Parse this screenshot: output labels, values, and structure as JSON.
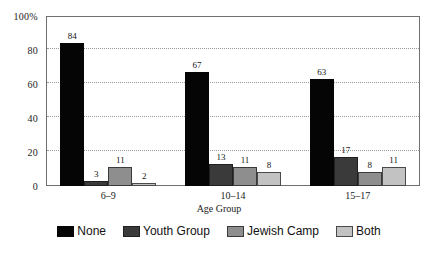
{
  "chart_data": {
    "type": "bar",
    "title": "",
    "xlabel": "Age Group",
    "ylabel": "",
    "ylim": [
      0,
      100
    ],
    "grid": true,
    "legend_position": "bottom",
    "categories": [
      "6–9",
      "10–14",
      "15–17"
    ],
    "yticks": [
      "0",
      "20",
      "40",
      "60",
      "80",
      "100%"
    ],
    "ytick_values": [
      0,
      20,
      40,
      60,
      80,
      100
    ],
    "series": [
      {
        "name": "None",
        "color": "#050505",
        "values": [
          84,
          67,
          63
        ]
      },
      {
        "name": "Youth Group",
        "color": "#3a3a3a",
        "values": [
          3,
          13,
          17
        ]
      },
      {
        "name": "Jewish Camp",
        "color": "#8e8e8e",
        "values": [
          11,
          11,
          8
        ]
      },
      {
        "name": "Both",
        "color": "#c2c2c2",
        "values": [
          2,
          8,
          11
        ]
      }
    ]
  }
}
